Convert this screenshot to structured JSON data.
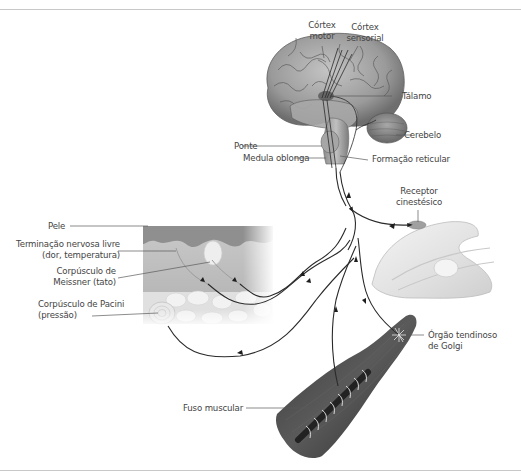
{
  "figure": {
    "type": "anatomical-diagram",
    "colors": {
      "background": "#ffffff",
      "frame_line": "#c8c8c8",
      "label_text": "#444444",
      "leader_line": "#555555",
      "nerve_path": "#2a2a2a",
      "brain": "#9a9a9a",
      "skin_epidermis": "#8f8f8f",
      "skin_dermis": "#b5b5b5",
      "fat_layer": "#dedede",
      "muscle": "#4a4a4a",
      "joint": "#e6e6e6"
    }
  },
  "labels": {
    "cortex_motor": [
      "Córtex",
      "motor"
    ],
    "cortex_sensorial": [
      "Córtex",
      "sensorial"
    ],
    "talamo": "Tálamo",
    "cerebelo": "Cerebelo",
    "ponte": "Ponte",
    "medula_oblonga": "Medula oblonga",
    "formacao_reticular": "Formação reticular",
    "receptor_cinestesico": [
      "Receptor",
      "cinestésico"
    ],
    "pele": "Pele",
    "terminacao_nervosa": [
      "Terminação nervosa livre",
      "(dor, temperatura)"
    ],
    "corpusculo_meissner": [
      "Corpúsculo de",
      "Meissner (tato)"
    ],
    "corpusculo_pacini": [
      "Corpúsculo de Pacini",
      "(pressão)"
    ],
    "orgao_golgi": [
      "Órgão tendinoso",
      "de Golgi"
    ],
    "fuso_muscular": "Fuso muscular"
  }
}
